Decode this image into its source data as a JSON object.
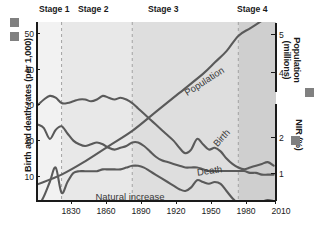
{
  "figure": {
    "kind": "demographic-transition-model"
  },
  "axes": {
    "left": {
      "title": "Birth and death rates (per 1,000)",
      "ticks": [
        "50",
        "40",
        "30",
        "20",
        "10"
      ],
      "tick_values": [
        50,
        40,
        30,
        20,
        10
      ]
    },
    "right_population": {
      "title": "Population (millions)",
      "ticks": [
        "5",
        "4"
      ],
      "tick_values": [
        5,
        4
      ]
    },
    "right_nir": {
      "title": "NIR (%)",
      "ticks": [
        "2",
        "1"
      ],
      "tick_values": [
        2,
        1
      ]
    },
    "bottom": {
      "ticks": [
        "1830",
        "1860",
        "1890",
        "1920",
        "1950",
        "1980",
        "2010"
      ],
      "tick_values": [
        1830,
        1860,
        1890,
        1920,
        1950,
        1980,
        2010
      ]
    }
  },
  "stages": [
    {
      "label": "Stage 1",
      "start": 1810,
      "end": 1830,
      "shade": "#f2f2f2"
    },
    {
      "label": "Stage 2",
      "start": 1830,
      "end": 1890,
      "shade": "#e8e8e8"
    },
    {
      "label": "Stage 3",
      "start": 1890,
      "end": 1980,
      "shade": "#dedede"
    },
    {
      "label": "Stage 4",
      "start": 1980,
      "end": 2012,
      "shade": "#cfcfcf"
    }
  ],
  "curve_labels": {
    "population": "Population",
    "birth": "Birth",
    "death": "Death",
    "natural_increase": "Natural increase"
  },
  "colors": {
    "curve": "#5a5a5a",
    "text": "#1a1a1a",
    "swatch": "#808080",
    "divider": "#9a9a9a"
  },
  "chart_data": {
    "type": "line",
    "title": "",
    "xlabel": "",
    "ylabel": "Birth and death rates (per 1,000)",
    "xlim": [
      1810,
      2012
    ],
    "ylim": [
      0,
      55
    ],
    "grid": false,
    "legend": "inline-labels",
    "series": [
      {
        "name": "Birth",
        "axis": "left",
        "unit": "per 1,000",
        "x": [
          1810,
          1815,
          1820,
          1825,
          1830,
          1835,
          1840,
          1845,
          1850,
          1855,
          1860,
          1865,
          1870,
          1875,
          1880,
          1885,
          1890,
          1895,
          1900,
          1905,
          1910,
          1915,
          1920,
          1925,
          1930,
          1935,
          1940,
          1945,
          1950,
          1955,
          1960,
          1965,
          1970,
          1975,
          1980,
          1985,
          1990,
          1995,
          2000,
          2005,
          2010
        ],
        "values": [
          30.0,
          31.5,
          32.5,
          32.0,
          30.5,
          30.5,
          31.0,
          31.5,
          31.5,
          31.0,
          31.5,
          32.5,
          32.0,
          31.5,
          32.0,
          31.5,
          30.5,
          29.0,
          27.5,
          26.0,
          24.5,
          23.0,
          21.5,
          20.0,
          18.0,
          16.5,
          17.5,
          20.5,
          19.0,
          17.5,
          18.0,
          17.0,
          15.0,
          13.5,
          12.5,
          12.0,
          12.5,
          13.0,
          13.5,
          14.0,
          13.0
        ]
      },
      {
        "name": "Death",
        "axis": "left",
        "unit": "per 1,000",
        "x": [
          1810,
          1815,
          1820,
          1825,
          1830,
          1835,
          1840,
          1845,
          1850,
          1855,
          1860,
          1865,
          1870,
          1875,
          1880,
          1885,
          1890,
          1895,
          1900,
          1905,
          1910,
          1915,
          1920,
          1925,
          1930,
          1935,
          1940,
          1945,
          1950,
          1955,
          1960,
          1965,
          1970,
          1975,
          1980,
          1985,
          1990,
          1995,
          2000,
          2005,
          2010
        ],
        "values": [
          24.5,
          23.5,
          20.5,
          23.0,
          24.0,
          22.0,
          20.0,
          19.0,
          18.5,
          19.0,
          19.5,
          19.0,
          18.0,
          17.5,
          18.0,
          18.5,
          19.5,
          19.5,
          18.5,
          17.0,
          15.5,
          14.5,
          14.0,
          13.5,
          13.0,
          12.5,
          12.5,
          12.5,
          12.0,
          11.5,
          11.5,
          11.5,
          11.5,
          11.5,
          11.5,
          11.5,
          11.0,
          11.0,
          10.5,
          10.5,
          10.5
        ]
      },
      {
        "name": "Natural increase",
        "axis": "right_nir",
        "unit": "%",
        "x": [
          1810,
          1815,
          1820,
          1825,
          1830,
          1835,
          1840,
          1845,
          1850,
          1855,
          1860,
          1865,
          1870,
          1875,
          1880,
          1885,
          1890,
          1895,
          1900,
          1905,
          1910,
          1915,
          1920,
          1925,
          1930,
          1935,
          1940,
          1945,
          1950,
          1955,
          1960,
          1965,
          1970,
          1975,
          1980,
          1985,
          1990,
          1995,
          2000,
          2005,
          2010
        ],
        "values": [
          0.05,
          0.35,
          0.75,
          1.15,
          0.45,
          0.75,
          1.0,
          1.05,
          1.05,
          1.05,
          1.05,
          1.1,
          1.1,
          1.1,
          1.1,
          1.15,
          1.2,
          1.2,
          1.15,
          1.05,
          0.95,
          0.85,
          0.75,
          0.65,
          0.55,
          0.5,
          0.6,
          0.8,
          0.75,
          0.7,
          0.75,
          0.7,
          0.5,
          0.3,
          0.15,
          0.1,
          0.12,
          0.15,
          0.2,
          0.25,
          0.22
        ]
      },
      {
        "name": "Population",
        "axis": "right_population",
        "unit": "millions",
        "x": [
          1810,
          1830,
          1850,
          1870,
          1890,
          1910,
          1930,
          1950,
          1960,
          1970,
          1980,
          1990,
          2000,
          2010
        ],
        "values": [
          1.05,
          1.3,
          1.65,
          2.05,
          2.45,
          2.95,
          3.45,
          3.95,
          4.25,
          4.55,
          4.95,
          5.15,
          5.35,
          5.55
        ]
      }
    ]
  }
}
